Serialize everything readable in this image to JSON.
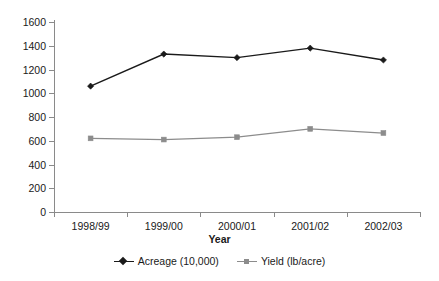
{
  "chart_data": {
    "type": "line",
    "title": "",
    "subtitle": "",
    "xlabel": "Year",
    "ylabel": "",
    "categories": [
      "1998/99",
      "1999/00",
      "2000/01",
      "2001/02",
      "2002/03"
    ],
    "series": [
      {
        "name": "Acreage (10,000)",
        "values": [
          1060,
          1330,
          1300,
          1380,
          1280
        ],
        "color": "#1a1a1a",
        "marker": "diamond"
      },
      {
        "name": "Yield (lb/acre)",
        "values": [
          620,
          610,
          630,
          700,
          665
        ],
        "color": "#8c8c8c",
        "marker": "square"
      }
    ],
    "ylim": [
      0,
      1600
    ],
    "ytick_step": 200,
    "ytick_labels": [
      "0",
      "200",
      "400",
      "600",
      "800",
      "1000",
      "1200",
      "1400",
      "1600"
    ],
    "grid": false,
    "legend_position": "bottom"
  },
  "axis": {
    "x_title": "Year"
  },
  "legend": {
    "entries": [
      {
        "label": "Acreage (10,000)"
      },
      {
        "label": "Yield (lb/acre)"
      }
    ]
  },
  "colors": {
    "acreage": "#1a1a1a",
    "yield": "#8c8c8c",
    "axis": "#8a8a8a",
    "background": "#ffffff"
  }
}
